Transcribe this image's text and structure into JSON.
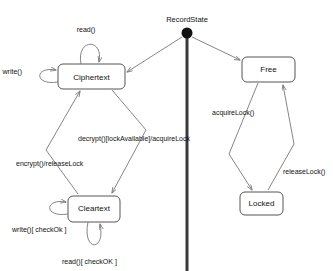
{
  "diagram": {
    "title": "RecordState",
    "type": "uml-state-diagram",
    "background": "#ffffff",
    "line_color": "#777777",
    "text_color": "#111111",
    "states": [
      {
        "id": "ciphertext",
        "label": "Ciphertext",
        "x": 58,
        "y": 64,
        "w": 67,
        "h": 25
      },
      {
        "id": "cleartext",
        "label": "Cleartext",
        "x": 68,
        "y": 196,
        "w": 52,
        "h": 26
      },
      {
        "id": "free",
        "label": "Free",
        "x": 242,
        "y": 57,
        "w": 53,
        "h": 25
      },
      {
        "id": "locked",
        "label": "Locked",
        "x": 240,
        "y": 192,
        "w": 43,
        "h": 23
      }
    ],
    "initial_node": {
      "cx": 187,
      "cy": 33,
      "r": 5.5
    },
    "transitions": [
      {
        "id": "t-read-self",
        "label": "read()",
        "lx": 86,
        "ly": 32
      },
      {
        "id": "t-write-self",
        "label": "write()",
        "lx": 22,
        "ly": 74
      },
      {
        "id": "t-decrypt",
        "label": "decrypt()[lockAvailable]/acquireLock",
        "lx": 78,
        "ly": 141
      },
      {
        "id": "t-encrypt",
        "label": "encrypt()/releaseLock",
        "lx": 16,
        "ly": 166
      },
      {
        "id": "t-write-checkok",
        "label": "write()[ checkOk ]",
        "lx": 12,
        "ly": 232
      },
      {
        "id": "t-read-checkok",
        "label": "read()[ checkOK ]",
        "lx": 62,
        "ly": 264
      },
      {
        "id": "t-acquirelock",
        "label": "acquireLock()",
        "lx": 212,
        "ly": 115
      },
      {
        "id": "t-releaselock",
        "label": "releaseLock()",
        "lx": 283,
        "ly": 174
      }
    ]
  }
}
